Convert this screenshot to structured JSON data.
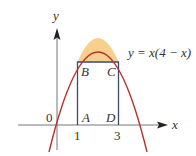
{
  "diagram": {
    "equation": "y = x(4 − x)",
    "axis_labels": {
      "x": "x",
      "y": "y"
    },
    "origin_label": "0",
    "tick_labels": [
      "1",
      "3"
    ],
    "points": {
      "A": "A",
      "B": "B",
      "C": "C",
      "D": "D"
    },
    "colors": {
      "curve": "#b5322e",
      "fill": "#f7d08e",
      "rectangle": "#3b4a66",
      "axes": "#777777"
    }
  }
}
